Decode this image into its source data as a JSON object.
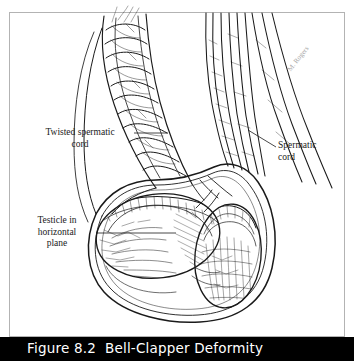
{
  "figure": {
    "caption": "Figure 8.2  Bell-Clapper Deformity",
    "caption_bar_color": "#000000",
    "caption_text_color": "#ffffff",
    "background_color": "#ffffff",
    "frame_color": "#b3b3b3",
    "ink_color": "#1a1a1a"
  },
  "labels": {
    "twisted_cord": "Twisted spermatic\ncord",
    "spermatic_cord": "Spermatic\ncord",
    "testicle": "Testicle in\nhorizontal\nplane"
  },
  "artwork": {
    "signature": "M. Rogers",
    "subject": "bell-clapper deformity with testicular torsion",
    "parts": [
      "twisted-spermatic-cord",
      "normal-spermatic-cord",
      "left-testicle-horizontal",
      "right-testicle-vertical",
      "scrotal-sac"
    ]
  }
}
